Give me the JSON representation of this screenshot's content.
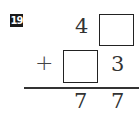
{
  "problem": {
    "number": "19",
    "row1": {
      "tens": "4",
      "ones": ""
    },
    "row2": {
      "operator": "+",
      "tens": "",
      "ones": "3"
    },
    "result": {
      "tens": "7",
      "ones": "7"
    }
  }
}
